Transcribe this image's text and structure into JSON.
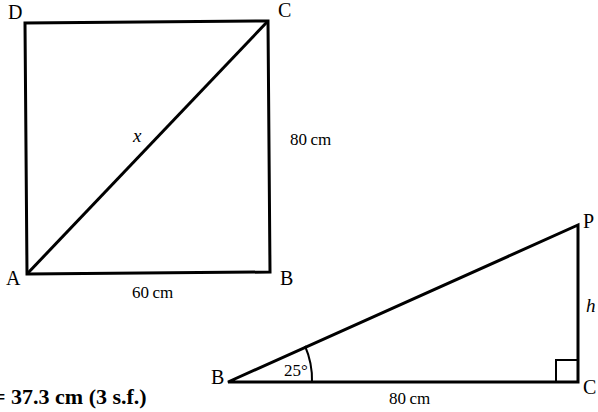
{
  "figures": [
    {
      "name": "square-diagonal-figure",
      "vertices": [
        {
          "label": "D",
          "x": 8,
          "y": 8
        },
        {
          "label": "C",
          "x": 278,
          "y": 4
        },
        {
          "label": "A",
          "x": 8,
          "y": 272
        },
        {
          "label": "B",
          "x": 280,
          "y": 272
        }
      ],
      "dimensions": [
        {
          "label": "60 cm",
          "x": 130,
          "y": 285
        },
        {
          "label": "80 cm",
          "x": 290,
          "y": 130
        }
      ],
      "unknown": {
        "label": "x",
        "x": 130,
        "y": 125
      }
    },
    {
      "name": "right-triangle-figure",
      "vertices": [
        {
          "label": "P",
          "x": 585,
          "y": 218
        },
        {
          "label": "B",
          "x": 213,
          "y": 370
        },
        {
          "label": "C",
          "x": 585,
          "y": 380
        }
      ],
      "dimensions": [
        {
          "label": "80 cm",
          "x": 390,
          "y": 392
        }
      ],
      "angles": [
        {
          "label": "25°",
          "x": 284,
          "y": 363
        }
      ],
      "unknown": {
        "label": "h",
        "x": 586,
        "y": 300
      },
      "right_angle_marker": true
    }
  ],
  "answer": {
    "text": "= 37.3 cm (3 s.f.)",
    "x": -6,
    "y": 388
  },
  "style": {
    "stroke": "#000000",
    "background": "#ffffff"
  }
}
